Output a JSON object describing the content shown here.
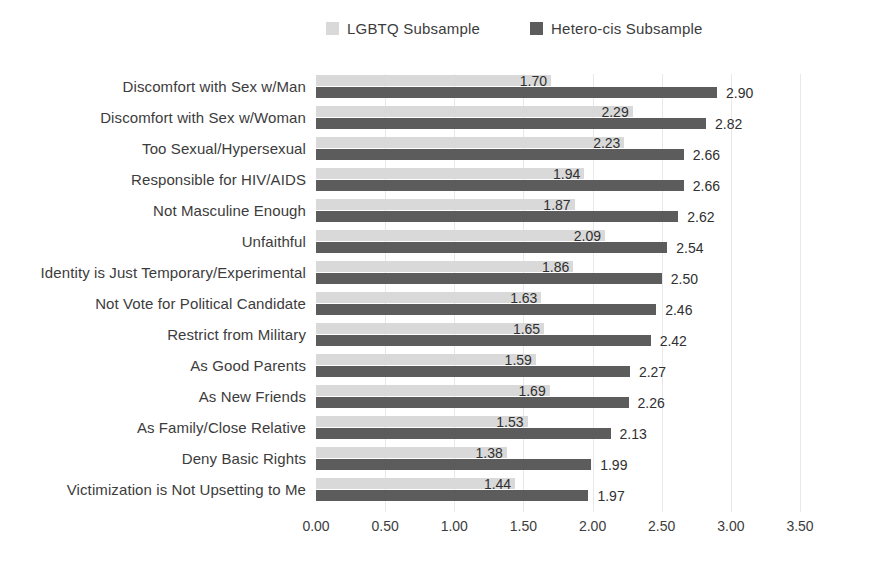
{
  "chart_data": {
    "type": "bar",
    "orientation": "horizontal",
    "title": "",
    "xlabel": "",
    "ylabel": "",
    "xlim": [
      0,
      3.5
    ],
    "x_ticks": [
      "0.00",
      "0.50",
      "1.00",
      "1.50",
      "2.00",
      "2.50",
      "3.00",
      "3.50"
    ],
    "grid": "vertical",
    "legend_position": "top-center",
    "value_labels": "two-decimal",
    "categories": [
      "Discomfort with Sex w/Man",
      "Discomfort with Sex w/Woman",
      "Too Sexual/Hypersexual",
      "Responsible for HIV/AIDS",
      "Not Masculine Enough",
      "Unfaithful",
      "Identity is Just Temporary/Experimental",
      "Not Vote for Political Candidate",
      "Restrict from Military",
      "As Good Parents",
      "As New Friends",
      "As Family/Close Relative",
      "Deny Basic Rights",
      "Victimization is Not Upsetting to Me"
    ],
    "series": [
      {
        "name": "LGBTQ Subsample",
        "color": "#d9d9d9",
        "values": [
          1.7,
          2.29,
          2.23,
          1.94,
          1.87,
          2.09,
          1.86,
          1.63,
          1.65,
          1.59,
          1.69,
          1.53,
          1.38,
          1.44
        ]
      },
      {
        "name": "Hetero-cis Subsample",
        "color": "#5c5c5c",
        "values": [
          2.9,
          2.82,
          2.66,
          2.66,
          2.62,
          2.54,
          2.5,
          2.46,
          2.42,
          2.27,
          2.26,
          2.13,
          1.99,
          1.97
        ]
      }
    ],
    "colors": {
      "grid": "#e8e8e8",
      "text": "#3c3c3c",
      "background": "#ffffff"
    }
  }
}
